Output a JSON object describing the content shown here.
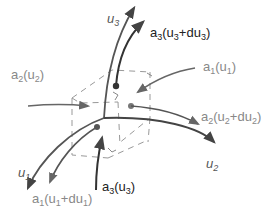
{
  "diagram": {
    "colors": {
      "axis": "#555555",
      "vector_dark": "#333333",
      "vector_grey": "#777777",
      "dashed": "#999999",
      "background": "#ffffff"
    },
    "labels": {
      "u3": {
        "base": "u",
        "sub": "3"
      },
      "u1": {
        "base": "u",
        "sub": "1"
      },
      "u2": {
        "base": "u",
        "sub": "2"
      },
      "a3_top": {
        "base": "a",
        "sub": "3",
        "arg_open": "(u",
        "arg_sub": "3",
        "arg_mid": "+du",
        "arg_sub2": "3",
        "arg_close": ")"
      },
      "a2_left": {
        "base": "a",
        "sub": "2",
        "arg_open": "(u",
        "arg_sub": "2",
        "arg_close": ")"
      },
      "a1_right": {
        "base": "a",
        "sub": "1",
        "arg_open": "(u",
        "arg_sub": "1",
        "arg_close": ")"
      },
      "a2_right": {
        "base": "a",
        "sub": "2",
        "arg_open": "(u",
        "arg_sub": "2",
        "arg_mid": "+du",
        "arg_sub2": "2",
        "arg_close": ")"
      },
      "a1_bottom": {
        "base": "a",
        "sub": "1",
        "arg_open": "(u",
        "arg_sub": "1",
        "arg_mid": "+du",
        "arg_sub2": "1",
        "arg_close": ")"
      },
      "a3_bottom": {
        "base": "a",
        "sub": "3",
        "arg_open": "(u",
        "arg_sub": "3",
        "arg_close": ")"
      }
    }
  }
}
